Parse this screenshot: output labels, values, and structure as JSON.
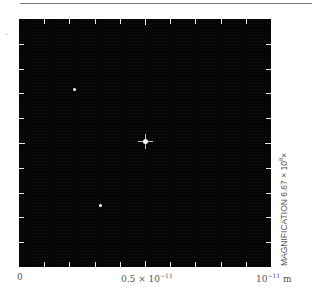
{
  "figure": {
    "type": "electron-micrograph-style image",
    "background_color": "#050505",
    "spot_color": "#ffffff",
    "ticks_per_side": 9,
    "divisions": 10
  },
  "axis": {
    "x_label_start": "0",
    "x_label_mid_mantissa": "0.5 × 10",
    "x_label_mid_exp": "−11",
    "x_label_end_base": "10",
    "x_label_end_exp": "−11",
    "x_label_end_unit": " m"
  },
  "magnification": {
    "prefix": "MAGNIFICATION 6.67 × 10",
    "exp": "8",
    "suffix": "×"
  },
  "spots": [
    {
      "name": "spot-upper-left",
      "x_px": 55,
      "y_px": 70,
      "size": 3
    },
    {
      "name": "spot-center",
      "x_px": 126,
      "y_px": 122,
      "size": 4,
      "cross": true
    },
    {
      "name": "spot-lower",
      "x_px": 81,
      "y_px": 186,
      "size": 3
    }
  ]
}
